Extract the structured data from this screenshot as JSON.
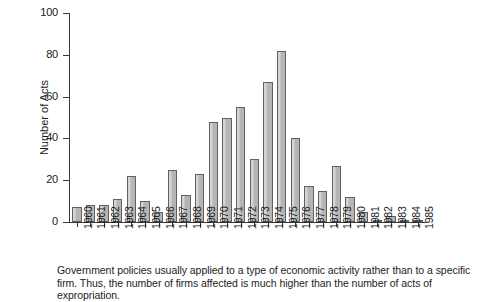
{
  "chart_data": {
    "type": "bar",
    "title": "",
    "xlabel": "",
    "ylabel": "Number of Acts",
    "ylim": [
      0,
      100
    ],
    "yticks": [
      0,
      20,
      40,
      60,
      80,
      100
    ],
    "grid": false,
    "legend": null,
    "categories": [
      "1960",
      "1961",
      "1962",
      "1963",
      "1964",
      "1965",
      "1966",
      "1967",
      "1968",
      "1969",
      "1970",
      "1971",
      "1972",
      "1973",
      "1974",
      "1975",
      "1976",
      "1977",
      "1978",
      "1979",
      "1980",
      "1981",
      "1982",
      "1983",
      "1984",
      "1985"
    ],
    "values": [
      7,
      8,
      8,
      11,
      22,
      10,
      5,
      25,
      13,
      23,
      48,
      50,
      55,
      30,
      67,
      82,
      40,
      17,
      15,
      27,
      12,
      5,
      1,
      3,
      1,
      1
    ],
    "bar_color": "#b5b5b5",
    "bar_edge_color": "#616161"
  },
  "caption": {
    "text": "Government policies usually applied to a type of economic activity rather than to a specific firm. Thus, the number of firms affected is much higher than the number of acts of expropriation."
  }
}
